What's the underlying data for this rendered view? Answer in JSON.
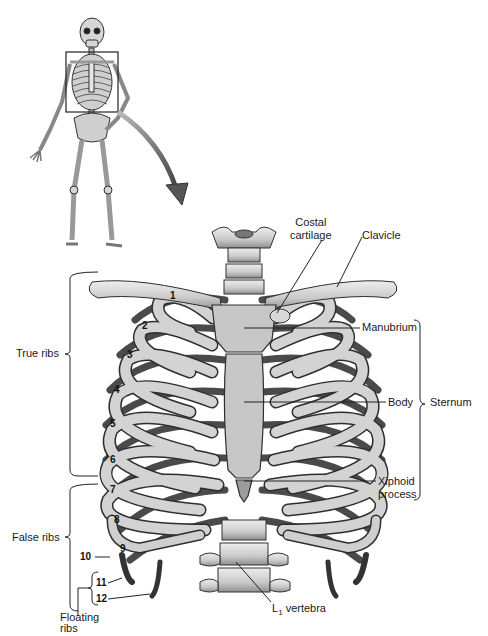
{
  "figure": {
    "inset": {
      "description": "Full skeleton with boxed thorax region and arrow pointing to enlarged view"
    },
    "labels": {
      "costal_cartilage": [
        "Costal",
        "cartilage"
      ],
      "clavicle": "Clavicle",
      "manubrium": "Manubrium",
      "body": "Body",
      "sternum": "Sternum",
      "xiphoid_process": [
        "Xiphoid",
        "process"
      ],
      "true_ribs": "True ribs",
      "false_ribs": "False ribs",
      "floating_ribs": [
        "Floating",
        "ribs"
      ],
      "l1_vertebra_prefix": "L",
      "l1_vertebra_sub": "1",
      "l1_vertebra_suffix": " vertebra"
    },
    "rib_numbers": [
      "1",
      "2",
      "3",
      "4",
      "5",
      "6",
      "7",
      "8",
      "9",
      "10",
      "11",
      "12"
    ],
    "colors": {
      "bone_light": "#d9d9d9",
      "bone_mid": "#a8a8a8",
      "bone_dark": "#555555",
      "outline": "#2a2a2a",
      "leader": "#222222"
    }
  }
}
